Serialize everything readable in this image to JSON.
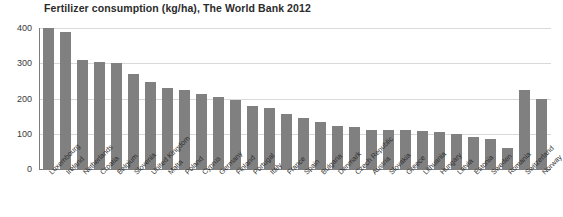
{
  "chart_data": {
    "type": "bar",
    "title": "Fertilizer consumption (kg/ha), The World Bank 2012",
    "xlabel": "",
    "ylabel": "",
    "ylim": [
      0,
      400
    ],
    "yticks": [
      0,
      100,
      200,
      300,
      400
    ],
    "grid": true,
    "legend": false,
    "bar_color": "#808080",
    "categories": [
      "Luxembourg",
      "Ireland",
      "Netherlands",
      "Croatia",
      "Belgium",
      "Slovenia",
      "United Kingdom",
      "Malta",
      "Poland",
      "Cyprus",
      "Germany",
      "Finland",
      "Portugal",
      "Italy",
      "France",
      "Spain",
      "Bulgaria",
      "Denmark",
      "Czech Republic",
      "Austria",
      "Slovakia",
      "Greece",
      "Lithuania",
      "Hungary",
      "Latvia",
      "Estonia",
      "Sweden",
      "Romania",
      "Switzerland",
      "Norway"
    ],
    "values": [
      400,
      390,
      310,
      305,
      300,
      270,
      248,
      230,
      223,
      212,
      205,
      196,
      180,
      172,
      155,
      145,
      132,
      122,
      118,
      112,
      110,
      110,
      108,
      106,
      100,
      92,
      85,
      60,
      225,
      200
    ]
  }
}
